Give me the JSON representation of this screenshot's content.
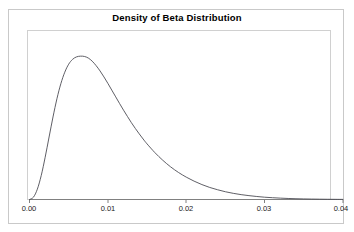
{
  "figure": {
    "title": "Density of Beta Distribution",
    "background_color": "#ffffff",
    "frame_color": "#c9c9c9",
    "plot_frame_color": "#d0d0d0",
    "curve_color": "#4d4d55",
    "axis_color": "#808080"
  },
  "chart_data": {
    "type": "line",
    "title": "Density of Beta Distribution",
    "xlabel": "",
    "ylabel": "",
    "grid": false,
    "legend": null,
    "xlim": [
      0.0,
      0.04
    ],
    "ylim": [
      0,
      105
    ],
    "xticks": [
      0.0,
      0.01,
      0.02,
      0.03,
      0.04
    ],
    "xtick_labels": [
      "0.00",
      "0.01",
      "0.02",
      "0.03",
      "0.04"
    ],
    "yticks": [],
    "ytick_labels": [],
    "distribution": "Beta",
    "peak_x": 0.0075,
    "peak_y": 100,
    "series": [
      {
        "name": "density",
        "x": [
          0.0,
          0.0005,
          0.001,
          0.0015,
          0.002,
          0.0025,
          0.003,
          0.0035,
          0.004,
          0.0045,
          0.005,
          0.0055,
          0.006,
          0.0065,
          0.007,
          0.0075,
          0.008,
          0.0085,
          0.009,
          0.0095,
          0.01,
          0.0105,
          0.011,
          0.0115,
          0.012,
          0.0125,
          0.013,
          0.0135,
          0.014,
          0.0145,
          0.015,
          0.016,
          0.017,
          0.018,
          0.019,
          0.02,
          0.021,
          0.022,
          0.023,
          0.024,
          0.025,
          0.026,
          0.027,
          0.028,
          0.029,
          0.03,
          0.031,
          0.032,
          0.033,
          0.034,
          0.035,
          0.036,
          0.037,
          0.038,
          0.039,
          0.04
        ],
        "y": [
          0.0,
          1.6,
          7.2,
          16.8,
          29.5,
          43.6,
          57.6,
          70.3,
          80.8,
          88.8,
          94.4,
          97.8,
          99.5,
          100.0,
          99.8,
          98.7,
          96.5,
          93.4,
          89.7,
          85.5,
          81.0,
          76.3,
          71.6,
          66.9,
          62.3,
          57.9,
          53.6,
          49.6,
          45.8,
          42.2,
          38.8,
          32.7,
          27.4,
          22.8,
          18.9,
          15.6,
          12.8,
          10.4,
          8.4,
          6.8,
          5.4,
          4.3,
          3.4,
          2.7,
          2.1,
          1.6,
          1.25,
          0.95,
          0.72,
          0.54,
          0.4,
          0.3,
          0.22,
          0.16,
          0.11,
          0.08
        ]
      }
    ]
  },
  "axis": {
    "tick_labels": [
      "0.00",
      "0.01",
      "0.02",
      "0.03",
      "0.04"
    ]
  }
}
